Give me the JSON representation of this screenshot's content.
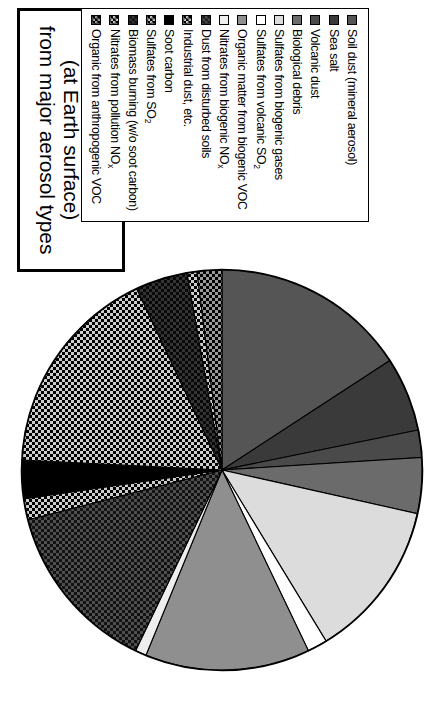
{
  "title": {
    "lines": [
      "Radiative effect",
      "(at Earth surface)",
      "from major aerosol types"
    ]
  },
  "legend": {
    "items": [
      {
        "label": "Soil dust (mineral aerosol)",
        "swatch": "solid-dark-grey"
      },
      {
        "label": "Sea salt",
        "swatch": "solid-dark-grey"
      },
      {
        "label": "Volcanic dust",
        "swatch": "solid-dark-grey"
      },
      {
        "label": "Biological debris",
        "swatch": "solid-mid-grey"
      },
      {
        "label": "Sulfates from biogenic gases",
        "swatch": "solid-light-grey"
      },
      {
        "label": "Sulfates from volcanic SO2",
        "swatch": "solid-white"
      },
      {
        "label": "Organic matter from biogenic VOC",
        "swatch": "solid-mid-grey"
      },
      {
        "label": "Nitrates from biogenic NOx",
        "swatch": "solid-very-light-grey"
      },
      {
        "label": "Dust from disturbed soils",
        "swatch": "checker-dark"
      },
      {
        "label": "Industrial dust, etc.",
        "swatch": "checker-light"
      },
      {
        "label": "Soot carbon",
        "swatch": "solid-black"
      },
      {
        "label": "Sulfates from SO2",
        "swatch": "checker-light"
      },
      {
        "label": "Biomass burning (w/o soot carbon)",
        "swatch": "checker-very-dark"
      },
      {
        "label": "Nitrates from pollution NOx",
        "swatch": "checker-light"
      },
      {
        "label": "Organic from anthropogenic VOC",
        "swatch": "checker-mid"
      }
    ]
  },
  "chart_data": {
    "type": "pie",
    "title": "Radiative effect (at Earth surface) from major aerosol types",
    "legend_position": "top-right",
    "labels": [
      "Soil dust (mineral aerosol)",
      "Sea salt",
      "Volcanic dust",
      "Biological debris",
      "Sulfates from biogenic gases",
      "Sulfates from volcanic SO2",
      "Organic matter from biogenic VOC",
      "Nitrates from biogenic NOx",
      "Dust from disturbed soils",
      "Industrial dust, etc.",
      "Soot carbon",
      "Sulfates from SO2",
      "Biomass burning (w/o soot carbon)",
      "Nitrates from pollution NOx",
      "Organic from anthropogenic VOC"
    ],
    "values": [
      15.8,
      6.0,
      2.2,
      4.5,
      12.8,
      1.6,
      13.3,
      0.9,
      13.9,
      1.7,
      3.1,
      17.2,
      4.2,
      0.8,
      2.0
    ],
    "units": "percent of total radiative effect",
    "start_angle_deg": 0,
    "direction": "clockwise",
    "segments": [
      {
        "label": "Soil dust (mineral aerosol)",
        "value": 15.8,
        "fill": "solid-dark-grey",
        "hex": "#555555"
      },
      {
        "label": "Sea salt",
        "value": 6.0,
        "fill": "solid-dark-grey",
        "hex": "#3a3a3a"
      },
      {
        "label": "Volcanic dust",
        "value": 2.2,
        "fill": "solid-dark-grey",
        "hex": "#4a4a4a"
      },
      {
        "label": "Biological debris",
        "value": 4.5,
        "fill": "solid-mid-grey",
        "hex": "#6b6b6b"
      },
      {
        "label": "Sulfates from biogenic gases",
        "value": 12.8,
        "fill": "solid-light-grey",
        "hex": "#dcdcdc"
      },
      {
        "label": "Sulfates from volcanic SO2",
        "value": 1.6,
        "fill": "solid-white",
        "hex": "#ffffff"
      },
      {
        "label": "Organic matter from biogenic VOC",
        "value": 13.3,
        "fill": "solid-mid-grey",
        "hex": "#8f8f8f"
      },
      {
        "label": "Nitrates from biogenic NOx",
        "value": 0.9,
        "fill": "solid-very-light-grey",
        "hex": "#eeeeee"
      },
      {
        "label": "Dust from disturbed soils",
        "value": 13.9,
        "fill": "checker-dark",
        "hex": "#1a1a1a"
      },
      {
        "label": "Industrial dust, etc.",
        "value": 1.7,
        "fill": "checker-light",
        "hex": "#c8c8c8"
      },
      {
        "label": "Soot carbon",
        "value": 3.1,
        "fill": "solid-black",
        "hex": "#000000"
      },
      {
        "label": "Sulfates from SO2",
        "value": 17.2,
        "fill": "checker-light",
        "hex": "#c8c8c8"
      },
      {
        "label": "Biomass burning (w/o soot carbon)",
        "value": 4.2,
        "fill": "checker-very-dark",
        "hex": "#111111"
      },
      {
        "label": "Nitrates from pollution NOx",
        "value": 0.8,
        "fill": "checker-light",
        "hex": "#c8c8c8"
      },
      {
        "label": "Organic from anthropogenic VOC",
        "value": 2.0,
        "fill": "checker-mid",
        "hex": "#9a9a9a"
      }
    ]
  }
}
